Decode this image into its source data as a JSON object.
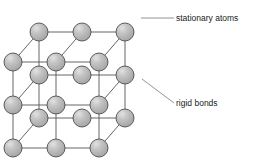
{
  "figure": {
    "background_color": "#ffffff"
  },
  "style": {
    "atom_fill": "#b0b0b0",
    "atom_highlight": "#d8d8d8",
    "atom_stroke": "#4d4d4d",
    "bond_color": "#555555",
    "leader_color": "#777777",
    "text_color": "#1a1a1a",
    "atom_radius": 9.0,
    "bond_width": 0.9,
    "atom_stroke_width": 0.9
  },
  "labels": {
    "stationary_atoms": {
      "text": "stationary atoms",
      "leader": {
        "x1": 141,
        "y1": 18,
        "x2": 174,
        "y2": 18
      }
    },
    "rigid_bonds": {
      "text": "rigid bonds",
      "leader": {
        "x1": 142,
        "y1": 79,
        "x2": 174,
        "y2": 103
      }
    }
  },
  "lattice": {
    "description": "3 x 3 front face and 3 x 3 back face, oblique projection",
    "columns": 3,
    "rows": 3,
    "depth_layers": 2,
    "front_origin": {
      "x": 13,
      "y": 62
    },
    "spacing_x": 43,
    "spacing_y": 43,
    "depth_offset": {
      "x": 26,
      "y": -30
    },
    "atoms": [
      {
        "id": "b00",
        "x": 39,
        "y": 32,
        "layer": "back"
      },
      {
        "id": "b10",
        "x": 82,
        "y": 32,
        "layer": "back"
      },
      {
        "id": "b20",
        "x": 125,
        "y": 32,
        "layer": "back"
      },
      {
        "id": "b01",
        "x": 39,
        "y": 75,
        "layer": "back"
      },
      {
        "id": "b11",
        "x": 82,
        "y": 75,
        "layer": "back"
      },
      {
        "id": "b21",
        "x": 125,
        "y": 75,
        "layer": "back"
      },
      {
        "id": "b02",
        "x": 39,
        "y": 118,
        "layer": "back"
      },
      {
        "id": "b12",
        "x": 82,
        "y": 118,
        "layer": "back"
      },
      {
        "id": "b22",
        "x": 125,
        "y": 118,
        "layer": "back"
      },
      {
        "id": "f00",
        "x": 13,
        "y": 62,
        "layer": "front"
      },
      {
        "id": "f10",
        "x": 56,
        "y": 62,
        "layer": "front"
      },
      {
        "id": "f20",
        "x": 99,
        "y": 62,
        "layer": "front"
      },
      {
        "id": "f01",
        "x": 13,
        "y": 105,
        "layer": "front"
      },
      {
        "id": "f11",
        "x": 56,
        "y": 105,
        "layer": "front"
      },
      {
        "id": "f21",
        "x": 99,
        "y": 105,
        "layer": "front"
      },
      {
        "id": "f02",
        "x": 13,
        "y": 148,
        "layer": "front"
      },
      {
        "id": "f12",
        "x": 56,
        "y": 148,
        "layer": "front"
      },
      {
        "id": "f22",
        "x": 99,
        "y": 148,
        "layer": "front"
      }
    ],
    "bonds": [
      {
        "from": "b00",
        "to": "b10"
      },
      {
        "from": "b10",
        "to": "b20"
      },
      {
        "from": "b01",
        "to": "b11"
      },
      {
        "from": "b11",
        "to": "b21"
      },
      {
        "from": "b02",
        "to": "b12"
      },
      {
        "from": "b12",
        "to": "b22"
      },
      {
        "from": "b00",
        "to": "b01"
      },
      {
        "from": "b01",
        "to": "b02"
      },
      {
        "from": "b20",
        "to": "b21"
      },
      {
        "from": "b21",
        "to": "b22"
      },
      {
        "from": "f00",
        "to": "f10"
      },
      {
        "from": "f10",
        "to": "f20"
      },
      {
        "from": "f01",
        "to": "f11"
      },
      {
        "from": "f11",
        "to": "f21"
      },
      {
        "from": "f02",
        "to": "f12"
      },
      {
        "from": "f12",
        "to": "f22"
      },
      {
        "from": "f00",
        "to": "f01"
      },
      {
        "from": "f01",
        "to": "f02"
      },
      {
        "from": "f10",
        "to": "f11"
      },
      {
        "from": "f11",
        "to": "f12"
      },
      {
        "from": "f20",
        "to": "f21"
      },
      {
        "from": "f21",
        "to": "f22"
      },
      {
        "from": "f00",
        "to": "b00"
      },
      {
        "from": "f10",
        "to": "b10"
      },
      {
        "from": "f20",
        "to": "b20"
      },
      {
        "from": "f01",
        "to": "b01"
      },
      {
        "from": "f21",
        "to": "b21"
      },
      {
        "from": "f02",
        "to": "b02"
      },
      {
        "from": "f22",
        "to": "b22"
      }
    ]
  }
}
